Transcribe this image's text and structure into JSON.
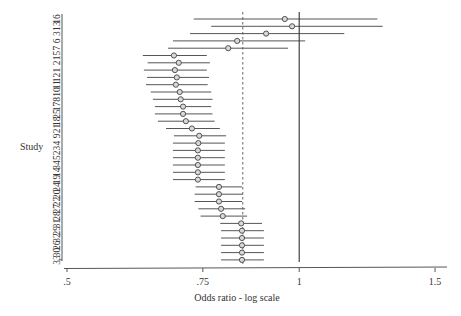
{
  "chart_data": {
    "type": "forest",
    "title": "",
    "xlabel": "Odds ratio - log scale",
    "ylabel": "Study",
    "x_scale": "log",
    "xlim": [
      0.49,
      1.6
    ],
    "xticks": [
      0.5,
      0.75,
      1,
      1.5
    ],
    "xtick_labels": [
      ".5",
      ".75",
      "1",
      "1.5"
    ],
    "reference_line": {
      "value": 1,
      "style": "solid"
    },
    "pooled_line": {
      "value": 0.845,
      "style": "dashed"
    },
    "grid": false,
    "legend": null,
    "marker": "hollow-circle",
    "studies": [
      {
        "label": "16",
        "or": 0.958,
        "lo": 0.73,
        "hi": 1.263
      },
      {
        "label": "13",
        "or": 0.979,
        "lo": 0.769,
        "hi": 1.283
      },
      {
        "label": "3",
        "or": 0.906,
        "lo": 0.722,
        "hi": 1.144
      },
      {
        "label": "6",
        "or": 0.831,
        "lo": 0.686,
        "hi": 1.018
      },
      {
        "label": "7",
        "or": 0.809,
        "lo": 0.676,
        "hi": 0.967
      },
      {
        "label": "15",
        "or": 0.688,
        "lo": 0.627,
        "hi": 0.759
      },
      {
        "label": "2",
        "or": 0.698,
        "lo": 0.636,
        "hi": 0.766
      },
      {
        "label": "1",
        "or": 0.69,
        "lo": 0.629,
        "hi": 0.759
      },
      {
        "label": "12",
        "or": 0.694,
        "lo": 0.635,
        "hi": 0.764
      },
      {
        "label": "11",
        "or": 0.692,
        "lo": 0.633,
        "hi": 0.761
      },
      {
        "label": "10",
        "or": 0.7,
        "lo": 0.642,
        "hi": 0.769
      },
      {
        "label": "8",
        "or": 0.702,
        "lo": 0.646,
        "hi": 0.772
      },
      {
        "label": "17",
        "or": 0.707,
        "lo": 0.65,
        "hi": 0.769
      },
      {
        "label": "25",
        "or": 0.707,
        "lo": 0.65,
        "hi": 0.772
      },
      {
        "label": "18",
        "or": 0.713,
        "lo": 0.656,
        "hi": 0.777
      },
      {
        "label": "21",
        "or": 0.726,
        "lo": 0.672,
        "hi": 0.789
      },
      {
        "label": "9",
        "or": 0.742,
        "lo": 0.688,
        "hi": 0.804
      },
      {
        "label": "4",
        "or": 0.74,
        "lo": 0.686,
        "hi": 0.801
      },
      {
        "label": "23",
        "or": 0.739,
        "lo": 0.686,
        "hi": 0.801
      },
      {
        "label": "5",
        "or": 0.739,
        "lo": 0.686,
        "hi": 0.801
      },
      {
        "label": "34",
        "or": 0.739,
        "lo": 0.686,
        "hi": 0.801
      },
      {
        "label": "14",
        "or": 0.739,
        "lo": 0.686,
        "hi": 0.801
      },
      {
        "label": "19",
        "or": 0.739,
        "lo": 0.686,
        "hi": 0.801
      },
      {
        "label": "24",
        "or": 0.787,
        "lo": 0.734,
        "hi": 0.843
      },
      {
        "label": "20",
        "or": 0.787,
        "lo": 0.732,
        "hi": 0.845
      },
      {
        "label": "22",
        "or": 0.787,
        "lo": 0.732,
        "hi": 0.843
      },
      {
        "label": "27",
        "or": 0.792,
        "lo": 0.74,
        "hi": 0.851
      },
      {
        "label": "28",
        "or": 0.796,
        "lo": 0.745,
        "hi": 0.856
      },
      {
        "label": "31",
        "or": 0.841,
        "lo": 0.79,
        "hi": 0.895
      },
      {
        "label": "29",
        "or": 0.843,
        "lo": 0.792,
        "hi": 0.9
      },
      {
        "label": "32",
        "or": 0.843,
        "lo": 0.792,
        "hi": 0.9
      },
      {
        "label": "26",
        "or": 0.843,
        "lo": 0.792,
        "hi": 0.9
      },
      {
        "label": "30",
        "or": 0.843,
        "lo": 0.792,
        "hi": 0.9
      },
      {
        "label": "33",
        "or": 0.843,
        "lo": 0.792,
        "hi": 0.9
      }
    ]
  },
  "colors": {
    "axis": "#555555",
    "ci_line": "#555555",
    "marker_stroke": "#444444",
    "marker_fill": "#d8d8d8",
    "reference_line": "#333333",
    "pooled_line": "#555555",
    "text": "#333333"
  }
}
